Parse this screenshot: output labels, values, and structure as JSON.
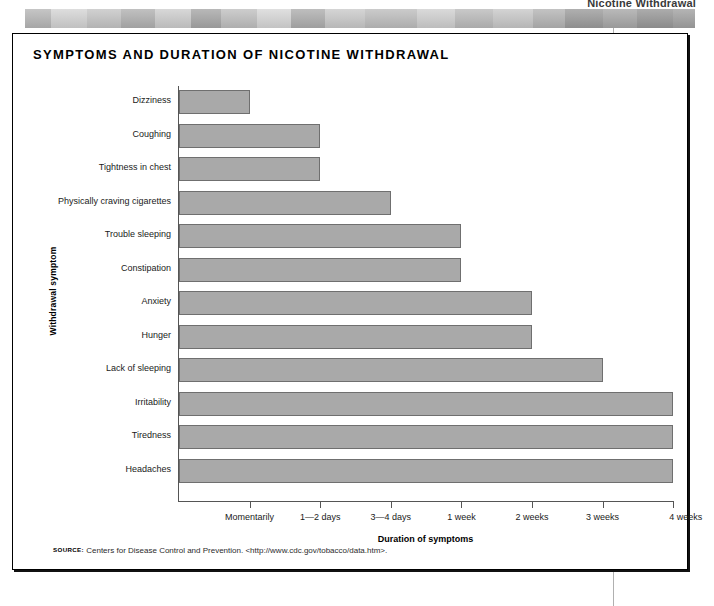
{
  "page": {
    "running_head": "Nicotine Withdrawal",
    "decorative_band": "grayscale-photo-strip"
  },
  "figure": {
    "title": "SYMPTOMS AND DURATION OF NICOTINE WITHDRAWAL",
    "source_kicker": "SOURCE:",
    "source_text": "Centers for Disease Control and Prevention. <http://www.cdc.gov/tobacco/data.htm>."
  },
  "colors": {
    "bar_fill": "#a9a9a9",
    "bar_border": "#6f6f6f",
    "axis": "#555555",
    "box_border": "#000000",
    "page_rule": "#b0b0b0"
  },
  "chart_data": {
    "type": "bar",
    "orientation": "horizontal",
    "title": "SYMPTOMS AND DURATION OF NICOTINE WITHDRAWAL",
    "xlabel": "Duration of symptoms",
    "ylabel": "Withdrawal symptom",
    "grid": false,
    "legend": "none",
    "xtick_labels": [
      "Momentarily",
      "1—2 days",
      "3—4 days",
      "1 week",
      "2 weeks",
      "3 weeks",
      "4 weeks"
    ],
    "xtick_values": [
      1,
      2,
      3,
      4,
      5,
      6,
      7
    ],
    "xlim": [
      0,
      7
    ],
    "categories": [
      "Dizziness",
      "Coughing",
      "Tightness in chest",
      "Physically craving cigarettes",
      "Trouble sleeping",
      "Constipation",
      "Anxiety",
      "Hunger",
      "Lack of sleeping",
      "Irritability",
      "Tiredness",
      "Headaches"
    ],
    "values": [
      1,
      2,
      2,
      3,
      4,
      4,
      5,
      5,
      6,
      7,
      7,
      7
    ],
    "value_labels": [
      "Momentarily",
      "1—2 days",
      "1—2 days",
      "3—4 days",
      "1 week",
      "1 week",
      "2 weeks",
      "2 weeks",
      "3 weeks",
      "4 weeks",
      "4 weeks",
      "4 weeks"
    ]
  }
}
